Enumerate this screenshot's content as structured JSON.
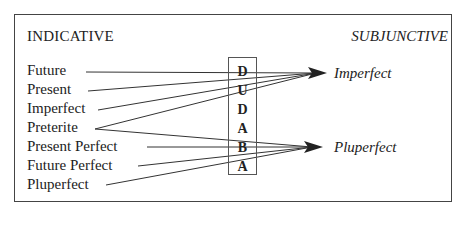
{
  "diagram": {
    "left_heading": "INDICATIVE",
    "right_heading": "SUBJUNCTIVE",
    "indicative_tenses": [
      {
        "label": "Future",
        "top": 63
      },
      {
        "label": "Present",
        "top": 82
      },
      {
        "label": "Imperfect",
        "top": 101
      },
      {
        "label": "Preterite",
        "top": 120
      },
      {
        "label": "Present Perfect",
        "top": 139
      },
      {
        "label": "Future Perfect",
        "top": 158
      },
      {
        "label": "Pluperfect",
        "top": 177
      }
    ],
    "subjunctive_tenses": [
      {
        "label": "Imperfect",
        "top": 66
      },
      {
        "label": "Pluperfect",
        "top": 140
      }
    ],
    "mnemonic": [
      "D",
      "U",
      "D",
      "A",
      "B",
      "A"
    ],
    "connections": [
      {
        "from": "Future",
        "to": "Imperfect"
      },
      {
        "from": "Present",
        "to": "Imperfect"
      },
      {
        "from": "Imperfect",
        "to": "Imperfect"
      },
      {
        "from": "Preterite",
        "to": "Imperfect"
      },
      {
        "from": "Preterite",
        "to": "Pluperfect"
      },
      {
        "from": "Present Perfect",
        "to": "Pluperfect"
      },
      {
        "from": "Future Perfect",
        "to": "Pluperfect"
      },
      {
        "from": "Pluperfect",
        "to": "Pluperfect"
      }
    ]
  }
}
